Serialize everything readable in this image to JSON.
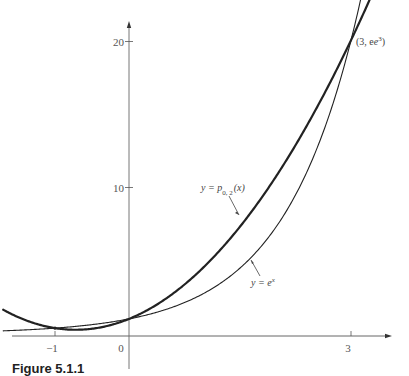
{
  "chart_data": {
    "type": "line",
    "title": "",
    "xlabel": "",
    "ylabel": "",
    "xlim": [
      -1.7,
      3.5
    ],
    "ylim": [
      0,
      22
    ],
    "grid": false,
    "legend": "none (inline curve labels)",
    "x_ticks": [
      {
        "value": -1,
        "label": "−1"
      },
      {
        "value": 0,
        "label": "0"
      },
      {
        "value": 3,
        "label": "3"
      }
    ],
    "y_ticks": [
      {
        "value": 10,
        "label": "10"
      },
      {
        "value": 20,
        "label": "20"
      }
    ],
    "series": [
      {
        "name": "y = e^x",
        "label": "y = e",
        "label_sup": "x",
        "style": "thin",
        "function": "exp(x)",
        "x": [
          -1.7,
          -1,
          0,
          1,
          2,
          3,
          3.2
        ],
        "values": [
          0.18,
          0.37,
          1.0,
          2.72,
          7.39,
          20.09,
          24.5
        ]
      },
      {
        "name": "y = p_{0,2}(x)",
        "label": "y = p",
        "label_sub": "0, 2",
        "label_tail": "(x)",
        "style": "thick",
        "function": "1 + 2.0645x + 1.4324x^2",
        "x": [
          -1.7,
          -1,
          0,
          1,
          2,
          3,
          3.25
        ],
        "values": [
          1.63,
          0.37,
          1.0,
          4.5,
          10.86,
          20.09,
          22.84
        ]
      }
    ],
    "annotations": [
      {
        "text": "(3, e³)",
        "point": [
          3,
          20.09
        ]
      },
      {
        "text": "y = p₀,₂(x)",
        "arrow_to_curve": "p_{0,2}"
      },
      {
        "text": "y = e^x",
        "arrow_to_curve": "e^x"
      }
    ],
    "intersections": [
      [
        -1,
        0.37
      ],
      [
        0,
        1
      ],
      [
        3,
        20.09
      ]
    ]
  },
  "labels": {
    "point_text": "(3, e",
    "point_sup": "3",
    "point_close": ")",
    "p_label_main": "y = p",
    "p_label_sub": "0, 2",
    "p_label_tail": "(x)",
    "e_label_main": "y = e",
    "e_label_sup": "x"
  },
  "caption": "Figure 5.1.1"
}
